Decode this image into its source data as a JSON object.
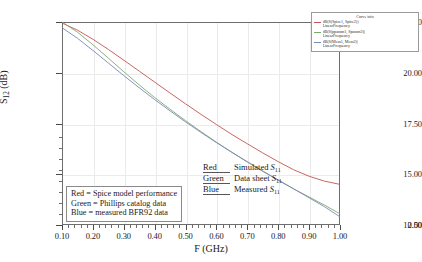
{
  "chart_data": {
    "type": "line",
    "title": "",
    "xlabel": "F (GHz)",
    "ylabel": "S12 (dB)",
    "ylabel_base": "S",
    "ylabel_sub": "12",
    "ylabel_unit": " (dB)",
    "xlim": [
      0.1,
      1.0
    ],
    "ylim": [
      12.5,
      22.5
    ],
    "y_axis_broken": true,
    "y_break_label": "0.00",
    "grid": true,
    "legend_position": "top-right",
    "xticks": [
      "0.10",
      "0.20",
      "0.30",
      "0.40",
      "0.50",
      "0.60",
      "0.70",
      "0.80",
      "0.90",
      "1.00"
    ],
    "xtick_values": [
      0.1,
      0.2,
      0.3,
      0.4,
      0.5,
      0.6,
      0.7,
      0.8,
      0.9,
      1.0
    ],
    "yticks": [
      "0.00",
      "12.50",
      "15.00",
      "17.50",
      "20.00",
      "22.50"
    ],
    "ytick_values": [
      12.5,
      15.0,
      17.5,
      20.0,
      22.5
    ],
    "x": [
      0.1,
      0.15,
      0.2,
      0.25,
      0.3,
      0.35,
      0.4,
      0.45,
      0.5,
      0.55,
      0.6,
      0.65,
      0.7,
      0.75,
      0.8,
      0.85,
      0.9,
      0.95,
      1.0
    ],
    "series": [
      {
        "name": "Simulated S11",
        "color": "#c4544f",
        "legend_key": "Red",
        "description": "Simulated S11",
        "values": [
          22.45,
          22.1,
          21.65,
          21.15,
          20.62,
          20.08,
          19.54,
          19.0,
          18.47,
          17.95,
          17.45,
          16.96,
          16.5,
          16.05,
          15.62,
          15.22,
          14.9,
          14.66,
          14.5
        ]
      },
      {
        "name": "Data sheet S11",
        "color": "#7fa86b",
        "legend_key": "Green",
        "description": "Data sheet S11",
        "values": [
          22.5,
          22.0,
          21.38,
          20.72,
          20.05,
          19.4,
          18.78,
          18.2,
          17.64,
          17.1,
          16.58,
          16.08,
          15.6,
          15.14,
          14.7,
          14.28,
          13.88,
          13.48,
          13.05
        ]
      },
      {
        "name": "Measured S11",
        "color": "#7a86b8",
        "legend_key": "Blue",
        "description": "Measured S11",
        "values": [
          22.22,
          21.7,
          21.1,
          20.48,
          19.86,
          19.26,
          18.68,
          18.12,
          17.58,
          17.06,
          16.56,
          16.08,
          15.62,
          15.16,
          14.72,
          14.28,
          13.84,
          13.4,
          12.9
        ]
      }
    ]
  },
  "curve_legend": {
    "title": "Curve info",
    "entries": [
      {
        "line1": "dB(S(Spice1, Spice2))",
        "line2": "LinearFrequency",
        "color": "#c4544f"
      },
      {
        "line1": "dB(S(pparam1, Sparam2))",
        "line2": "LinearFrequency",
        "color": "#7fa86b"
      },
      {
        "line1": "dB(S(Meas1, Meas2))",
        "line2": "LinearFrequency",
        "color": "#7a86b8"
      }
    ]
  },
  "color_key": {
    "rows": [
      {
        "color_word": "Red",
        "desc_text": "Simulated ",
        "symbol": "S",
        "symbol_sub": "11"
      },
      {
        "color_word": "Green",
        "desc_text": "Data sheet ",
        "symbol": "S",
        "symbol_sub": "11"
      },
      {
        "color_word": "Blue",
        "desc_text": "Measured ",
        "symbol": "S",
        "symbol_sub": "11"
      }
    ]
  },
  "note_box": {
    "lines": [
      "Red = Spice model performance",
      "Green = Phillips catalog data",
      "Blue = measured BFR92 data"
    ]
  }
}
